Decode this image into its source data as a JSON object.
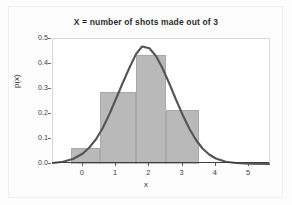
{
  "chart_data": {
    "type": "bar",
    "title": "X = number of shots made out of 3",
    "xlabel": "x",
    "ylabel": "p(x)",
    "categories": [
      "0",
      "1",
      "2",
      "3"
    ],
    "values": [
      0.0625,
      0.29,
      0.435,
      0.215
    ],
    "bar_width": 1,
    "bar_edges": [
      [
        -0.35,
        0.5
      ],
      [
        0.5,
        1.6
      ],
      [
        1.6,
        2.5
      ],
      [
        2.5,
        3.5
      ]
    ],
    "xlim": [
      -0.9,
      5.6
    ],
    "ylim": [
      0.0,
      0.5
    ],
    "xticks": [
      "0",
      "1",
      "2",
      "3",
      "4",
      "5"
    ],
    "xtick_values": [
      0,
      1,
      2,
      3,
      4,
      5
    ],
    "yticks": [
      "0.0",
      "0.1",
      "0.2",
      "0.3",
      "0.4",
      "0.5"
    ],
    "ytick_values": [
      0.0,
      0.1,
      0.2,
      0.3,
      0.4,
      0.5
    ],
    "grid": false,
    "legend": null,
    "series": [
      {
        "name": "probability-histogram",
        "type": "bar",
        "values": [
          0.0625,
          0.29,
          0.435,
          0.215
        ],
        "color": "#b9b9b9"
      },
      {
        "name": "normal-approximation-curve",
        "type": "line",
        "color": "#555555",
        "peak_x": 1.78,
        "peak_y": 0.47,
        "x": [
          -0.9,
          -0.6,
          -0.3,
          0.0,
          0.2,
          0.4,
          0.6,
          0.8,
          1.0,
          1.2,
          1.4,
          1.6,
          1.78,
          2.0,
          2.2,
          2.4,
          2.6,
          2.8,
          3.0,
          3.2,
          3.4,
          3.6,
          3.8,
          4.0,
          4.3,
          4.6,
          5.0,
          5.6
        ],
        "y": [
          0.004,
          0.009,
          0.02,
          0.042,
          0.067,
          0.1,
          0.145,
          0.2,
          0.262,
          0.325,
          0.385,
          0.44,
          0.47,
          0.463,
          0.432,
          0.382,
          0.322,
          0.258,
          0.197,
          0.142,
          0.097,
          0.062,
          0.038,
          0.022,
          0.009,
          0.004,
          0.0015,
          0.0005
        ]
      }
    ]
  },
  "colors": {
    "bar_fill": "#b9b9b9",
    "bar_edge": "#a8a8a8",
    "curve": "#555555",
    "axis": "#3f3f3f",
    "plot_background": "#ffffff",
    "figure_background": "#fdfdfd",
    "text": "#2b2b2b"
  }
}
